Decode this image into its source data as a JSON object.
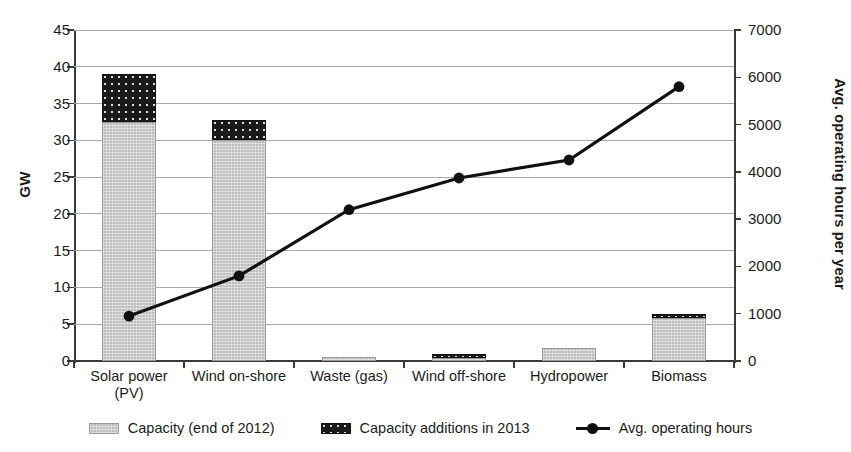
{
  "chart_data": {
    "type": "bar",
    "title": "",
    "subtitle": "",
    "categories": [
      "Solar power (PV)",
      "Wind on-shore",
      "Waste (gas)",
      "Wind off-shore",
      "Hydropower",
      "Biomass"
    ],
    "category_lines": [
      [
        "Solar power",
        "(PV)"
      ],
      [
        "Wind on-shore"
      ],
      [
        "Waste (gas)"
      ],
      [
        "Wind off-shore"
      ],
      [
        "Hydropower"
      ],
      [
        "Biomass"
      ]
    ],
    "xlabel": "",
    "ylabel": "GW",
    "ylabel_secondary": "Avg. operating hours per year",
    "ylim": [
      0,
      45
    ],
    "ylim_secondary": [
      0,
      7000
    ],
    "yticks": [
      0,
      5,
      10,
      15,
      20,
      25,
      30,
      35,
      40,
      45
    ],
    "yticks_secondary": [
      0,
      1000,
      2000,
      3000,
      4000,
      5000,
      6000,
      7000
    ],
    "ytick_labels": [
      "0",
      "5",
      "10",
      "15",
      "20",
      "25",
      "30",
      "35",
      "40",
      "45"
    ],
    "ytick_labels_secondary": [
      "0",
      "1000",
      "2000",
      "3000",
      "4000",
      "5000",
      "6000",
      "7000"
    ],
    "grid": true,
    "legend_position": "bottom",
    "stacked": true,
    "series": [
      {
        "name": "Capacity (end of 2012)",
        "axis": "left",
        "unit": "GW",
        "type": "bar",
        "color": "#bdbdbd",
        "pattern": "light-gray-fill",
        "values": [
          32.5,
          30.0,
          0.5,
          0.4,
          1.8,
          5.9
        ]
      },
      {
        "name": "Capacity additions in 2013",
        "axis": "left",
        "unit": "GW",
        "type": "bar",
        "color": "#1a1a1a",
        "pattern": "dark-dotted-fill",
        "values": [
          6.5,
          2.7,
          0.0,
          0.5,
          0.0,
          0.3
        ]
      },
      {
        "name": "Avg. operating hours",
        "axis": "right",
        "unit": "hours per year",
        "type": "line",
        "color": "#111111",
        "marker": "circle",
        "values": [
          950,
          1800,
          3200,
          3870,
          4250,
          5800
        ]
      }
    ]
  },
  "legend": {
    "items": [
      {
        "label": "Capacity (end of 2012)",
        "swatch": "base"
      },
      {
        "label": "Capacity additions in 2013",
        "swatch": "add"
      },
      {
        "label": "Avg. operating hours",
        "swatch": "line"
      }
    ]
  }
}
